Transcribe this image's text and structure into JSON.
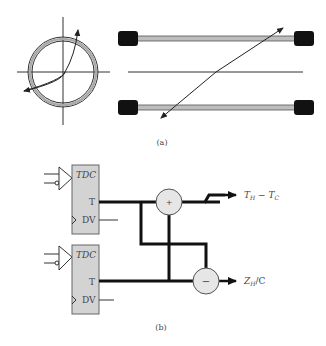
{
  "figure": {
    "panel_a": {
      "label": "(a)",
      "description": "Pipe cross-section with ultrasonic path and two transducer pairs with diagonal path"
    },
    "panel_b": {
      "label": "(b)",
      "tdc_top": {
        "title": "TDC",
        "pin_t": "T",
        "pin_dv": "DV"
      },
      "tdc_bottom": {
        "title": "TDC",
        "pin_t": "T",
        "pin_dv": "DV"
      },
      "adder": {
        "symbol": "+"
      },
      "subtractor": {
        "symbol": "−"
      },
      "output_top": {
        "main": "T",
        "sub1": "H",
        "mid": " − T",
        "sub2": "C"
      },
      "output_bottom": {
        "main": "Z",
        "sub1": "H",
        "tail": "/C"
      }
    },
    "colors": {
      "box_fill": "#d3d3d3",
      "box_stroke": "#666666",
      "wire": "#111111",
      "pipe_fill": "#bdbdbd",
      "transducer": "#111111"
    }
  }
}
